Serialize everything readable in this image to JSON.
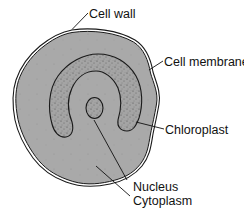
{
  "diagram": {
    "labels": {
      "cell_wall": "Cell wall",
      "cell_membrane": "Cell membrane",
      "chloroplast": "Chloroplast",
      "nucleus": "Nucleus",
      "cytoplasm": "Cytoplasm"
    },
    "colors": {
      "cytoplasm_fill": "#a9a9a9",
      "chloroplast_fill": "#a3a3a3",
      "chloroplast_stipple": "#555555",
      "outline": "#1a1a1a",
      "background": "#ffffff"
    }
  }
}
